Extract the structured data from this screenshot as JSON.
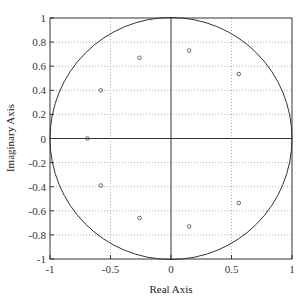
{
  "chart_data": {
    "type": "scatter",
    "title": "",
    "xlabel": "Real Axis",
    "ylabel": "Imaginary Axis",
    "xlim": [
      -1,
      1
    ],
    "ylim": [
      -1,
      1
    ],
    "grid": true,
    "grid_style": "dotted",
    "legend": null,
    "xticks": [
      -1,
      -0.5,
      0,
      0.5,
      1
    ],
    "xtick_labels": [
      "-1",
      "-0.5",
      "0",
      "0.5",
      "1"
    ],
    "yticks": [
      -1,
      -0.8,
      -0.6,
      -0.4,
      -0.2,
      0,
      0.2,
      0.4,
      0.6,
      0.8,
      1
    ],
    "ytick_labels": [
      "-1",
      "-0.8",
      "-0.6",
      "-0.4",
      "-0.2",
      "0",
      "0.2",
      "0.4",
      "0.6",
      "0.8",
      "1"
    ],
    "annotations": [
      "unit circle",
      "solid axis lines at x=0 and y=0"
    ],
    "series": [
      {
        "name": "points",
        "marker": "circle",
        "points": [
          {
            "x": -0.69,
            "y": 0.0
          },
          {
            "x": -0.58,
            "y": 0.4
          },
          {
            "x": -0.58,
            "y": -0.39
          },
          {
            "x": -0.26,
            "y": 0.67
          },
          {
            "x": -0.26,
            "y": -0.66
          },
          {
            "x": 0.15,
            "y": 0.73
          },
          {
            "x": 0.15,
            "y": -0.73
          },
          {
            "x": 0.56,
            "y": 0.535
          },
          {
            "x": 0.56,
            "y": -0.535
          }
        ]
      }
    ],
    "unit_circle": {
      "center": [
        0,
        0
      ],
      "radius": 1
    }
  },
  "colors": {
    "axes": "#333333",
    "grid": "#9a9a9a",
    "circle": "#333333",
    "marker": "#555555"
  }
}
